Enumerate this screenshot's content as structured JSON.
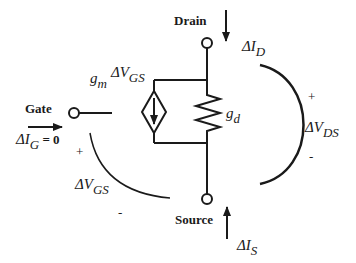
{
  "terminals": {
    "gate": "Gate",
    "drain": "Drain",
    "source": "Source"
  },
  "currents": {
    "gate": {
      "delta": "ΔI",
      "sub": "G",
      "suffix": " = 0"
    },
    "drain": {
      "delta": "ΔI",
      "sub": "D"
    },
    "source": {
      "delta": "ΔI",
      "sub": "S"
    }
  },
  "components": {
    "current_source": {
      "coef": "g",
      "coef_sub": "m",
      "delta": "ΔV",
      "sub": "GS"
    },
    "conductance": {
      "symbol": "g",
      "sub": "d"
    }
  },
  "voltages": {
    "vgs": {
      "delta": "ΔV",
      "sub": "GS",
      "plus": "+",
      "minus": "-"
    },
    "vds": {
      "delta": "ΔV",
      "sub": "DS",
      "plus": "+",
      "minus": "-"
    }
  },
  "colors": {
    "stroke": "#1a1a1a",
    "background": "#ffffff"
  }
}
